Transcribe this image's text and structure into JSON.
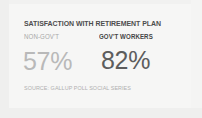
{
  "card": {
    "title": "SATISFACTION WITH RETIREMENT PLAN",
    "source": "SOURCE: GALLUP POLL SOCIAL SERIES",
    "background_color": "#f1f1f0",
    "panel_color": "#f6f6f5"
  },
  "chart_data": {
    "type": "table",
    "title": "SATISFACTION WITH RETIREMENT PLAN",
    "subtitle": "",
    "categories": [
      "NON-GOV'T",
      "GOV'T WORKERS"
    ],
    "values": [
      57,
      82
    ],
    "value_labels": [
      "57%",
      "82%"
    ],
    "unit": "%",
    "xlabel": "",
    "ylabel": "",
    "annotations": [
      "SOURCE: GALLUP POLL SOCIAL SERIES"
    ],
    "legend": [],
    "grid": false,
    "series": [
      {
        "name": "Satisfaction with retirement plan",
        "values": [
          57,
          82
        ]
      }
    ]
  },
  "columns": [
    {
      "label": "NON-GOV'T",
      "value": "57%",
      "emphasis": "muted",
      "label_color": "#a8a8a8",
      "value_color": "#b9b9b9"
    },
    {
      "label": "GOV'T WORKERS",
      "value": "82%",
      "emphasis": "strong",
      "label_color": "#454545",
      "value_color": "#5d5d5d"
    }
  ]
}
